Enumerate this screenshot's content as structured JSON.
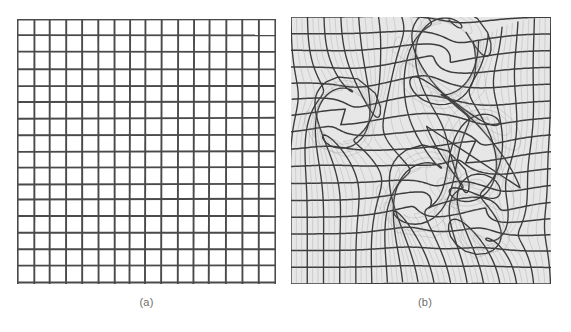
{
  "figure": {
    "background_color": "#ffffff",
    "panels": [
      {
        "id": "a",
        "caption": "(a)",
        "description": "Undistorted regular square grid",
        "grid_columns": 16,
        "grid_rows": 16,
        "line_color": "#4a4a4a",
        "line_color_light": "#9a9a9a",
        "background_color": "#ffffff",
        "x": 17,
        "y": 19,
        "width": 259,
        "height": 265
      },
      {
        "id": "b",
        "caption": "(b)",
        "description": "Distorted grid showing cusp and swirl caustic structures",
        "grid_columns": 16,
        "grid_rows": 16,
        "line_color": "#3c3c3c",
        "line_color_light": "#8c8c8c",
        "background_color": "#e9e9e9",
        "x": 291,
        "y": 17,
        "width": 260,
        "height": 267
      }
    ]
  },
  "chart_data": {
    "type": "line",
    "xlabel": "",
    "ylabel": "",
    "panels": [
      {
        "label": "(a)",
        "kind": "regular-grid",
        "columns": 16,
        "rows": 16,
        "x_ticks": [
          0,
          1,
          2,
          3,
          4,
          5,
          6,
          7,
          8,
          9,
          10,
          11,
          12,
          13,
          14,
          15,
          16
        ],
        "y_ticks": [
          0,
          1,
          2,
          3,
          4,
          5,
          6,
          7,
          8,
          9,
          10,
          11,
          12,
          13,
          14,
          15,
          16
        ],
        "xlim": [
          0,
          16
        ],
        "ylim": [
          0,
          16
        ],
        "grid": true
      },
      {
        "label": "(b)",
        "kind": "distorted-grid",
        "columns": 16,
        "rows": 16,
        "xlim": [
          0,
          16
        ],
        "ylim": [
          0,
          16
        ],
        "grid": true,
        "distortion_centers": [
          {
            "cx": 9.3,
            "cy": 2.4,
            "strength": 2.6,
            "radius": 5.2
          },
          {
            "cx": 3.2,
            "cy": 6.0,
            "strength": 2.0,
            "radius": 4.2
          },
          {
            "cx": 11.0,
            "cy": 8.0,
            "strength": 2.8,
            "radius": 5.0
          },
          {
            "cx": 8.2,
            "cy": 11.2,
            "strength": 2.4,
            "radius": 4.6
          },
          {
            "cx": 12.6,
            "cy": 11.6,
            "strength": 2.2,
            "radius": 4.0
          }
        ]
      }
    ]
  }
}
